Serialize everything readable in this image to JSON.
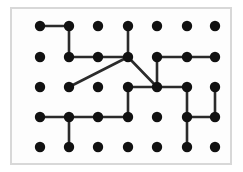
{
  "figure": {
    "type": "dot-grid-diagram",
    "frame": {
      "x": 10,
      "y": 7,
      "width": 222,
      "height": 158,
      "border_color": "#d8d8d8",
      "border_width": 2,
      "fill_color": "#fdfdfd"
    },
    "grid": {
      "columns": 7,
      "rows": 5,
      "x_positions": [
        40,
        69,
        98,
        128,
        157,
        187,
        215
      ],
      "y_positions": [
        26,
        57,
        87,
        117,
        147
      ],
      "dot_radius": 5.2,
      "dot_color": "#111111"
    },
    "edge_color": "#2b2b2b",
    "edge_width": 2.6,
    "edges": [
      {
        "from": [
          0,
          0
        ],
        "to": [
          1,
          0
        ],
        "kind": "horizontal"
      },
      {
        "from": [
          1,
          0
        ],
        "to": [
          1,
          1
        ],
        "kind": "vertical"
      },
      {
        "from": [
          1,
          1
        ],
        "to": [
          2,
          1
        ],
        "kind": "horizontal"
      },
      {
        "from": [
          2,
          1
        ],
        "to": [
          3,
          1
        ],
        "kind": "horizontal"
      },
      {
        "from": [
          3,
          0
        ],
        "to": [
          3,
          1
        ],
        "kind": "vertical"
      },
      {
        "from": [
          3,
          1
        ],
        "to": [
          1,
          2
        ],
        "kind": "diagonal"
      },
      {
        "from": [
          3,
          1
        ],
        "to": [
          4,
          2
        ],
        "kind": "diagonal"
      },
      {
        "from": [
          4,
          1
        ],
        "to": [
          5,
          1
        ],
        "kind": "horizontal"
      },
      {
        "from": [
          5,
          1
        ],
        "to": [
          6,
          1
        ],
        "kind": "horizontal"
      },
      {
        "from": [
          4,
          1
        ],
        "to": [
          4,
          2
        ],
        "kind": "vertical"
      },
      {
        "from": [
          3,
          2
        ],
        "to": [
          4,
          2
        ],
        "kind": "horizontal"
      },
      {
        "from": [
          4,
          2
        ],
        "to": [
          5,
          2
        ],
        "kind": "horizontal"
      },
      {
        "from": [
          3,
          2
        ],
        "to": [
          3,
          3
        ],
        "kind": "vertical"
      },
      {
        "from": [
          5,
          2
        ],
        "to": [
          5,
          3
        ],
        "kind": "vertical"
      },
      {
        "from": [
          6,
          2
        ],
        "to": [
          6,
          3
        ],
        "kind": "vertical"
      },
      {
        "from": [
          0,
          3
        ],
        "to": [
          1,
          3
        ],
        "kind": "horizontal"
      },
      {
        "from": [
          1,
          3
        ],
        "to": [
          2,
          3
        ],
        "kind": "horizontal"
      },
      {
        "from": [
          2,
          3
        ],
        "to": [
          3,
          3
        ],
        "kind": "horizontal"
      },
      {
        "from": [
          1,
          3
        ],
        "to": [
          1,
          4
        ],
        "kind": "vertical"
      },
      {
        "from": [
          5,
          3
        ],
        "to": [
          6,
          3
        ],
        "kind": "horizontal"
      },
      {
        "from": [
          5,
          3
        ],
        "to": [
          5,
          4
        ],
        "kind": "vertical"
      }
    ],
    "isolated_dots": [
      [
        2,
        0
      ],
      [
        4,
        0
      ],
      [
        5,
        0
      ],
      [
        6,
        0
      ],
      [
        0,
        1
      ],
      [
        0,
        2
      ],
      [
        2,
        2
      ],
      [
        4,
        3
      ],
      [
        0,
        4
      ],
      [
        2,
        4
      ],
      [
        3,
        4
      ],
      [
        4,
        4
      ],
      [
        6,
        4
      ]
    ]
  }
}
